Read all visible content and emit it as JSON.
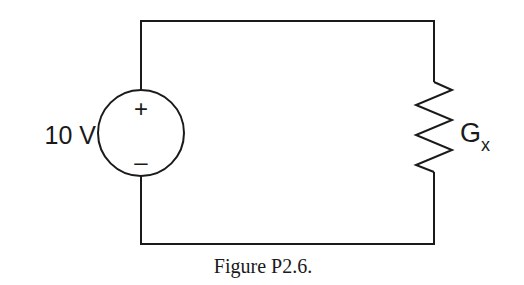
{
  "figure": {
    "caption": "Figure P2.6.",
    "type": "circuit-schematic"
  },
  "source": {
    "kind": "independent-voltage-source",
    "label": "10 V",
    "polarity_top": "+",
    "polarity_bottom": "–"
  },
  "load": {
    "kind": "resistor",
    "label_main": "G",
    "label_sub": "x"
  },
  "colors": {
    "stroke": "#1a1a1a",
    "background": "#ffffff"
  }
}
